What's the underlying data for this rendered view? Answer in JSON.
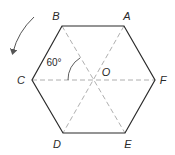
{
  "diagram": {
    "type": "regular-hexagon",
    "vertices": [
      {
        "label": "A",
        "x": 124,
        "y": 26,
        "lx": 127,
        "ly": 16
      },
      {
        "label": "B",
        "x": 62,
        "y": 26,
        "lx": 56,
        "ly": 16
      },
      {
        "label": "C",
        "x": 32,
        "y": 80,
        "lx": 21,
        "ly": 80
      },
      {
        "label": "D",
        "x": 63,
        "y": 133,
        "lx": 57,
        "ly": 144
      },
      {
        "label": "E",
        "x": 125,
        "y": 133,
        "lx": 128,
        "ly": 144
      },
      {
        "label": "F",
        "x": 155,
        "y": 80,
        "lx": 163,
        "ly": 80
      }
    ],
    "center": {
      "label": "O",
      "x": 93,
      "y": 80,
      "lx": 106,
      "ly": 72
    },
    "angle": {
      "label": "60°",
      "x": 54,
      "y": 63
    },
    "diagonals": [
      "A-D",
      "B-E",
      "C-F"
    ],
    "rotation_arrow": "counterclockwise"
  },
  "colors": {
    "edge": "#2b2b2b",
    "dashed": "#9a9a9a",
    "text": "#2a2a2a"
  }
}
